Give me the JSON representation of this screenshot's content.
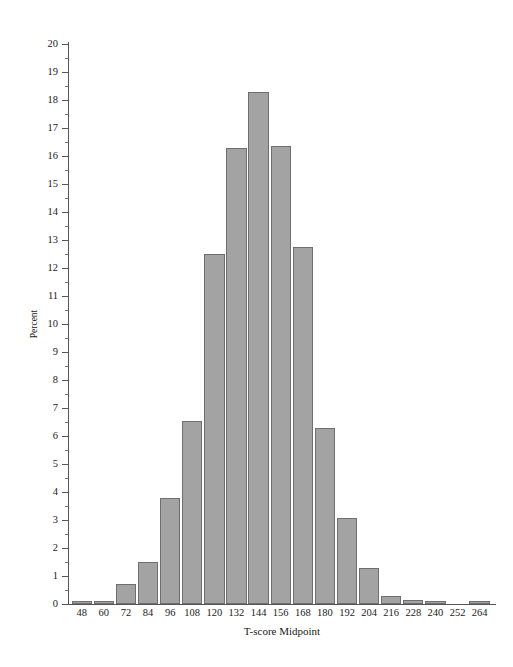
{
  "chart_data": {
    "type": "bar",
    "title": "",
    "subtitle": "",
    "xlabel": "T-score Midpoint",
    "ylabel": "Percent",
    "categories": [
      "48",
      "60",
      "72",
      "84",
      "96",
      "108",
      "120",
      "132",
      "144",
      "156",
      "168",
      "180",
      "192",
      "204",
      "216",
      "228",
      "240",
      "252",
      "264"
    ],
    "values": [
      0.1,
      0.1,
      0.7,
      1.5,
      3.78,
      6.52,
      12.5,
      16.3,
      18.3,
      16.35,
      12.75,
      6.28,
      3.08,
      1.3,
      0.3,
      0.15,
      0.12,
      0.0,
      0.12
    ],
    "ylim": [
      0,
      20
    ],
    "ytick_labels": [
      "0",
      "1",
      "2",
      "3",
      "4",
      "5",
      "6",
      "7",
      "8",
      "9",
      "10",
      "11",
      "12",
      "13",
      "14",
      "15",
      "16",
      "17",
      "18",
      "19",
      "20"
    ],
    "ytick_values": [
      0,
      1,
      2,
      3,
      4,
      5,
      6,
      7,
      8,
      9,
      10,
      11,
      12,
      13,
      14,
      15,
      16,
      17,
      18,
      19,
      20
    ],
    "grid": false,
    "legend": "none",
    "bar_color": "#a3a3a3",
    "bar_border_color": "#6f6f6f",
    "axis_color": "#555555",
    "background_color": "#ffffff"
  }
}
